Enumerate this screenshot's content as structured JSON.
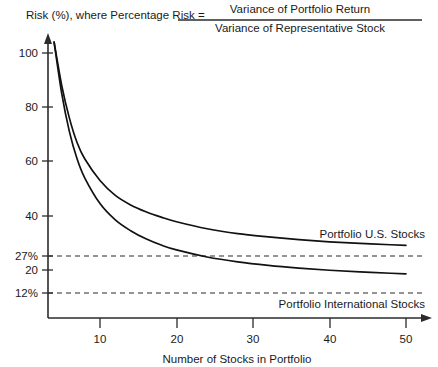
{
  "chart_data": {
    "type": "line",
    "title": "Risk (%), where Percentage Risk =",
    "title_numerator": "Variance of Portfolio Return",
    "title_denominator": "Variance of Representative Stock",
    "xlabel": "Number of Stocks in Portfolio",
    "ylabel": "Risk (%)",
    "xlim": [
      0,
      53
    ],
    "ylim": [
      0,
      108
    ],
    "grid": false,
    "legend_position": "inline-right",
    "x_ticks": [
      10,
      20,
      30,
      40,
      50
    ],
    "x_tick_labels": [
      "10",
      "20",
      "30",
      "40",
      "50"
    ],
    "y_ticks": [
      20,
      40,
      60,
      80,
      100
    ],
    "y_tick_labels": [
      "20",
      "40",
      "60",
      "80",
      "100"
    ],
    "annotation_ticks": [
      {
        "value": 27,
        "label": "27%"
      },
      {
        "value": 12,
        "label": "12%"
      }
    ],
    "x": [
      4,
      5,
      6,
      7,
      8,
      10,
      12,
      14,
      16,
      18,
      20,
      24,
      28,
      32,
      36,
      40,
      44,
      48,
      50
    ],
    "series": [
      {
        "name": "Portfolio U.S. Stocks",
        "label": "Portfolio U.S. Stocks",
        "asymptote": 27,
        "values": [
          104,
          88,
          76,
          67,
          61,
          53,
          47.5,
          44,
          41.5,
          39.5,
          37.8,
          35.2,
          33.4,
          32.2,
          31.2,
          30.4,
          29.8,
          29.3,
          29.1
        ]
      },
      {
        "name": "Portfolio International Stocks",
        "label": "Portfolio International Stocks",
        "asymptote": 12,
        "values": [
          104,
          85,
          71,
          61,
          54,
          44.5,
          38.5,
          34.5,
          31.5,
          29.2,
          27.4,
          24.8,
          23.0,
          21.7,
          20.7,
          19.9,
          19.3,
          18.8,
          18.6
        ]
      }
    ]
  }
}
